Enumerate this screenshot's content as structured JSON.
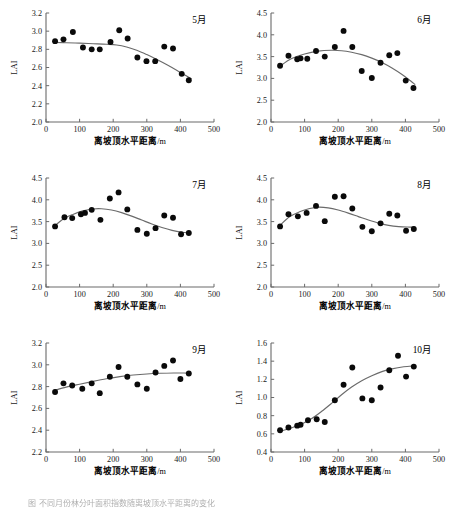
{
  "figure": {
    "axis_x_title": "离坡顶水平距离",
    "axis_x_unit": "/m",
    "axis_y_title": "LAI",
    "caption_fragment": "图   不同月份林分叶面积指数随离坡顶水平距离的变化"
  },
  "chart_data": [
    {
      "type": "scatter",
      "title": "5月",
      "xlabel": "离坡顶水平距离/m",
      "ylabel": "LAI",
      "xlim": [
        0,
        500
      ],
      "ylim": [
        2.0,
        3.2
      ],
      "xticks": [
        0,
        100,
        200,
        300,
        400,
        500
      ],
      "yticks": [
        2.0,
        2.2,
        2.4,
        2.6,
        2.8,
        3.0,
        3.2
      ],
      "grid": false,
      "legend": "none",
      "points": [
        {
          "x": 27,
          "y": 2.89
        },
        {
          "x": 52,
          "y": 2.91
        },
        {
          "x": 80,
          "y": 2.99
        },
        {
          "x": 110,
          "y": 2.82
        },
        {
          "x": 136,
          "y": 2.8
        },
        {
          "x": 160,
          "y": 2.8
        },
        {
          "x": 192,
          "y": 2.88
        },
        {
          "x": 218,
          "y": 3.01
        },
        {
          "x": 243,
          "y": 2.92
        },
        {
          "x": 272,
          "y": 2.71
        },
        {
          "x": 299,
          "y": 2.67
        },
        {
          "x": 325,
          "y": 2.67
        },
        {
          "x": 352,
          "y": 2.83
        },
        {
          "x": 378,
          "y": 2.81
        },
        {
          "x": 404,
          "y": 2.53
        },
        {
          "x": 425,
          "y": 2.46
        }
      ],
      "fit": [
        {
          "x": 27,
          "y": 2.875
        },
        {
          "x": 60,
          "y": 2.873
        },
        {
          "x": 100,
          "y": 2.868
        },
        {
          "x": 140,
          "y": 2.862
        },
        {
          "x": 180,
          "y": 2.856
        },
        {
          "x": 210,
          "y": 2.848
        },
        {
          "x": 240,
          "y": 2.826
        },
        {
          "x": 270,
          "y": 2.79
        },
        {
          "x": 300,
          "y": 2.742
        },
        {
          "x": 330,
          "y": 2.688
        },
        {
          "x": 360,
          "y": 2.63
        },
        {
          "x": 390,
          "y": 2.567
        },
        {
          "x": 410,
          "y": 2.522
        },
        {
          "x": 432,
          "y": 2.478
        }
      ]
    },
    {
      "type": "scatter",
      "title": "6月",
      "xlabel": "离坡顶水平距离/m",
      "ylabel": "LAI",
      "xlim": [
        0,
        500
      ],
      "ylim": [
        2.0,
        4.5
      ],
      "xticks": [
        0,
        100,
        200,
        300,
        400,
        500
      ],
      "yticks": [
        2.0,
        2.5,
        3.0,
        3.5,
        4.0,
        4.5
      ],
      "grid": false,
      "legend": "none",
      "points": [
        {
          "x": 27,
          "y": 3.29
        },
        {
          "x": 52,
          "y": 3.52
        },
        {
          "x": 78,
          "y": 3.44
        },
        {
          "x": 88,
          "y": 3.46
        },
        {
          "x": 108,
          "y": 3.45
        },
        {
          "x": 134,
          "y": 3.63
        },
        {
          "x": 160,
          "y": 3.5
        },
        {
          "x": 190,
          "y": 3.72
        },
        {
          "x": 216,
          "y": 4.09
        },
        {
          "x": 242,
          "y": 3.72
        },
        {
          "x": 270,
          "y": 3.17
        },
        {
          "x": 300,
          "y": 3.01
        },
        {
          "x": 326,
          "y": 3.36
        },
        {
          "x": 352,
          "y": 3.53
        },
        {
          "x": 376,
          "y": 3.58
        },
        {
          "x": 401,
          "y": 2.95
        },
        {
          "x": 424,
          "y": 2.78
        }
      ],
      "fit": [
        {
          "x": 25,
          "y": 3.27
        },
        {
          "x": 60,
          "y": 3.45
        },
        {
          "x": 100,
          "y": 3.56
        },
        {
          "x": 140,
          "y": 3.625
        },
        {
          "x": 180,
          "y": 3.645
        },
        {
          "x": 210,
          "y": 3.635
        },
        {
          "x": 240,
          "y": 3.6
        },
        {
          "x": 270,
          "y": 3.545
        },
        {
          "x": 300,
          "y": 3.465
        },
        {
          "x": 330,
          "y": 3.365
        },
        {
          "x": 360,
          "y": 3.24
        },
        {
          "x": 390,
          "y": 3.09
        },
        {
          "x": 415,
          "y": 2.945
        },
        {
          "x": 428,
          "y": 2.865
        }
      ]
    },
    {
      "type": "scatter",
      "title": "7月",
      "xlabel": "离坡顶水平距离/m",
      "ylabel": "LAI",
      "xlim": [
        0,
        500
      ],
      "ylim": [
        2.0,
        4.5
      ],
      "xticks": [
        0,
        100,
        200,
        300,
        400,
        500
      ],
      "yticks": [
        2.0,
        2.5,
        3.0,
        3.5,
        4.0,
        4.5
      ],
      "grid": false,
      "legend": "none",
      "points": [
        {
          "x": 27,
          "y": 3.39
        },
        {
          "x": 55,
          "y": 3.6
        },
        {
          "x": 78,
          "y": 3.58
        },
        {
          "x": 104,
          "y": 3.67
        },
        {
          "x": 116,
          "y": 3.7
        },
        {
          "x": 136,
          "y": 3.77
        },
        {
          "x": 162,
          "y": 3.54
        },
        {
          "x": 190,
          "y": 4.03
        },
        {
          "x": 216,
          "y": 4.17
        },
        {
          "x": 242,
          "y": 3.78
        },
        {
          "x": 272,
          "y": 3.31
        },
        {
          "x": 300,
          "y": 3.22
        },
        {
          "x": 326,
          "y": 3.35
        },
        {
          "x": 352,
          "y": 3.64
        },
        {
          "x": 378,
          "y": 3.59
        },
        {
          "x": 402,
          "y": 3.21
        },
        {
          "x": 425,
          "y": 3.24
        }
      ],
      "fit": [
        {
          "x": 25,
          "y": 3.39
        },
        {
          "x": 50,
          "y": 3.555
        },
        {
          "x": 80,
          "y": 3.665
        },
        {
          "x": 110,
          "y": 3.745
        },
        {
          "x": 140,
          "y": 3.79
        },
        {
          "x": 165,
          "y": 3.795
        },
        {
          "x": 195,
          "y": 3.765
        },
        {
          "x": 225,
          "y": 3.705
        },
        {
          "x": 255,
          "y": 3.625
        },
        {
          "x": 285,
          "y": 3.535
        },
        {
          "x": 315,
          "y": 3.445
        },
        {
          "x": 345,
          "y": 3.365
        },
        {
          "x": 375,
          "y": 3.3
        },
        {
          "x": 405,
          "y": 3.255
        },
        {
          "x": 428,
          "y": 3.235
        }
      ]
    },
    {
      "type": "scatter",
      "title": "8月",
      "xlabel": "离坡顶水平距离/m",
      "ylabel": "LAI",
      "xlim": [
        0,
        500
      ],
      "ylim": [
        2.0,
        4.5
      ],
      "xticks": [
        0,
        100,
        200,
        300,
        400,
        500
      ],
      "yticks": [
        2.0,
        2.5,
        3.0,
        3.5,
        4.0,
        4.5
      ],
      "grid": false,
      "legend": "none",
      "points": [
        {
          "x": 27,
          "y": 3.39
        },
        {
          "x": 52,
          "y": 3.67
        },
        {
          "x": 80,
          "y": 3.62
        },
        {
          "x": 106,
          "y": 3.7
        },
        {
          "x": 134,
          "y": 3.86
        },
        {
          "x": 160,
          "y": 3.51
        },
        {
          "x": 190,
          "y": 4.07
        },
        {
          "x": 216,
          "y": 4.08
        },
        {
          "x": 242,
          "y": 3.8
        },
        {
          "x": 272,
          "y": 3.38
        },
        {
          "x": 300,
          "y": 3.28
        },
        {
          "x": 326,
          "y": 3.46
        },
        {
          "x": 352,
          "y": 3.68
        },
        {
          "x": 376,
          "y": 3.64
        },
        {
          "x": 402,
          "y": 3.29
        },
        {
          "x": 425,
          "y": 3.33
        }
      ],
      "fit": [
        {
          "x": 25,
          "y": 3.4
        },
        {
          "x": 55,
          "y": 3.61
        },
        {
          "x": 85,
          "y": 3.725
        },
        {
          "x": 115,
          "y": 3.8
        },
        {
          "x": 140,
          "y": 3.83
        },
        {
          "x": 170,
          "y": 3.815
        },
        {
          "x": 200,
          "y": 3.765
        },
        {
          "x": 230,
          "y": 3.695
        },
        {
          "x": 260,
          "y": 3.615
        },
        {
          "x": 290,
          "y": 3.535
        },
        {
          "x": 320,
          "y": 3.465
        },
        {
          "x": 350,
          "y": 3.415
        },
        {
          "x": 380,
          "y": 3.385
        },
        {
          "x": 405,
          "y": 3.375
        },
        {
          "x": 428,
          "y": 3.375
        }
      ]
    },
    {
      "type": "scatter",
      "title": "9月",
      "xlabel": "离坡顶水平距离/m",
      "ylabel": "LAI",
      "xlim": [
        0,
        500
      ],
      "ylim": [
        2.2,
        3.2
      ],
      "xticks": [
        0,
        100,
        200,
        300,
        400,
        500
      ],
      "yticks": [
        2.2,
        2.4,
        2.6,
        2.8,
        3.0,
        3.2
      ],
      "grid": false,
      "legend": "none",
      "points": [
        {
          "x": 27,
          "y": 2.75
        },
        {
          "x": 52,
          "y": 2.83
        },
        {
          "x": 78,
          "y": 2.81
        },
        {
          "x": 108,
          "y": 2.78
        },
        {
          "x": 136,
          "y": 2.83
        },
        {
          "x": 160,
          "y": 2.74
        },
        {
          "x": 190,
          "y": 2.89
        },
        {
          "x": 216,
          "y": 2.98
        },
        {
          "x": 242,
          "y": 2.89
        },
        {
          "x": 272,
          "y": 2.82
        },
        {
          "x": 300,
          "y": 2.78
        },
        {
          "x": 326,
          "y": 2.93
        },
        {
          "x": 352,
          "y": 2.99
        },
        {
          "x": 378,
          "y": 3.04
        },
        {
          "x": 400,
          "y": 2.87
        },
        {
          "x": 425,
          "y": 2.92
        }
      ],
      "fit": [
        {
          "x": 25,
          "y": 2.765
        },
        {
          "x": 60,
          "y": 2.795
        },
        {
          "x": 100,
          "y": 2.822
        },
        {
          "x": 140,
          "y": 2.848
        },
        {
          "x": 180,
          "y": 2.872
        },
        {
          "x": 220,
          "y": 2.892
        },
        {
          "x": 260,
          "y": 2.906
        },
        {
          "x": 300,
          "y": 2.916
        },
        {
          "x": 340,
          "y": 2.922
        },
        {
          "x": 380,
          "y": 2.925
        },
        {
          "x": 410,
          "y": 2.925
        },
        {
          "x": 430,
          "y": 2.924
        }
      ]
    },
    {
      "type": "scatter",
      "title": "10月",
      "xlabel": "离坡顶水平距离/m",
      "ylabel": "LAI",
      "xlim": [
        0,
        500
      ],
      "ylim": [
        0.4,
        1.6
      ],
      "xticks": [
        0,
        100,
        200,
        300,
        400,
        500
      ],
      "yticks": [
        0.4,
        0.6,
        0.8,
        1.0,
        1.2,
        1.4,
        1.6
      ],
      "grid": false,
      "legend": "none",
      "points": [
        {
          "x": 27,
          "y": 0.64
        },
        {
          "x": 52,
          "y": 0.67
        },
        {
          "x": 78,
          "y": 0.69
        },
        {
          "x": 88,
          "y": 0.7
        },
        {
          "x": 110,
          "y": 0.75
        },
        {
          "x": 136,
          "y": 0.76
        },
        {
          "x": 160,
          "y": 0.73
        },
        {
          "x": 190,
          "y": 0.97
        },
        {
          "x": 216,
          "y": 1.14
        },
        {
          "x": 242,
          "y": 1.33
        },
        {
          "x": 272,
          "y": 0.99
        },
        {
          "x": 300,
          "y": 0.97
        },
        {
          "x": 326,
          "y": 1.11
        },
        {
          "x": 352,
          "y": 1.3
        },
        {
          "x": 378,
          "y": 1.46
        },
        {
          "x": 402,
          "y": 1.23
        },
        {
          "x": 425,
          "y": 1.34
        }
      ],
      "fit": [
        {
          "x": 25,
          "y": 0.625
        },
        {
          "x": 60,
          "y": 0.665
        },
        {
          "x": 90,
          "y": 0.705
        },
        {
          "x": 120,
          "y": 0.765
        },
        {
          "x": 150,
          "y": 0.845
        },
        {
          "x": 180,
          "y": 0.935
        },
        {
          "x": 210,
          "y": 1.03
        },
        {
          "x": 240,
          "y": 1.115
        },
        {
          "x": 270,
          "y": 1.185
        },
        {
          "x": 300,
          "y": 1.24
        },
        {
          "x": 330,
          "y": 1.285
        },
        {
          "x": 360,
          "y": 1.315
        },
        {
          "x": 395,
          "y": 1.338
        },
        {
          "x": 425,
          "y": 1.348
        }
      ]
    }
  ]
}
